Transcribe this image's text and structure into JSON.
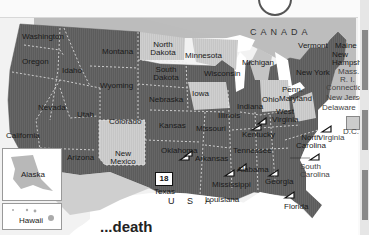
{
  "map": {
    "country_label": "CANADA",
    "country_main_label": "U S A",
    "caption": "...death",
    "badge": {
      "state": "Texas",
      "value": "18"
    },
    "colors": {
      "dark_state": "#5f5f5f",
      "light_state": "#c4c4c4",
      "water_lakes": "#ffffff",
      "canada": "#bdbdbd",
      "ocean": "#ffffff",
      "marker_fill": "#ffffff",
      "marker_stroke": "#111111"
    },
    "states": {
      "washington": "Washington",
      "oregon": "Oregon",
      "california": "California",
      "nevada": "Nevada",
      "idaho": "Idaho",
      "montana": "Montana",
      "wyoming": "Wyoming",
      "utah": "Utah",
      "colorado": "Colorado",
      "arizona": "Arizona",
      "new_mexico": "New Mexico",
      "north_dakota": "North Dakota",
      "south_dakota": "South Dakota",
      "nebraska": "Nebraska",
      "kansas": "Kansas",
      "oklahoma": "Oklahoma",
      "texas": "Texas",
      "minnesota": "Minnesota",
      "iowa": "Iowa",
      "missouri": "Missouri",
      "arkansas": "Arkansas",
      "louisiana": "Louisiana",
      "wisconsin": "Wisconsin",
      "illinois": "Illinois",
      "michigan": "Michigan",
      "indiana": "Indiana",
      "ohio": "Ohio",
      "kentucky": "Kentucky",
      "tennessee": "Tennessee",
      "mississippi": "Mississippi",
      "alabama": "Alabama",
      "georgia": "Georgia",
      "florida": "Florida",
      "south_carolina": "South Carolina",
      "north_carolina": "North Carolina",
      "virginia": "Virginia",
      "west_virginia": "West Virginia",
      "penn": "Penn.",
      "new_york": "New York",
      "vermont": "Vermont",
      "maine": "Maine",
      "new_hampshire": "New Hampshire",
      "mass": "Mass.",
      "ri": "R. I.",
      "connecticut": "Connecticut",
      "new_jersey": "New Jersey",
      "delaware": "Delaware",
      "maryland": "Maryland",
      "dc": "D.C.",
      "alaska": "Alaska",
      "hawaii": "Hawaii"
    },
    "markers": [
      "Ohio",
      "Kentucky",
      "Virginia",
      "Oklahoma",
      "Arkansas",
      "Mississippi",
      "Alabama",
      "Georgia",
      "South Carolina",
      "Florida"
    ]
  }
}
